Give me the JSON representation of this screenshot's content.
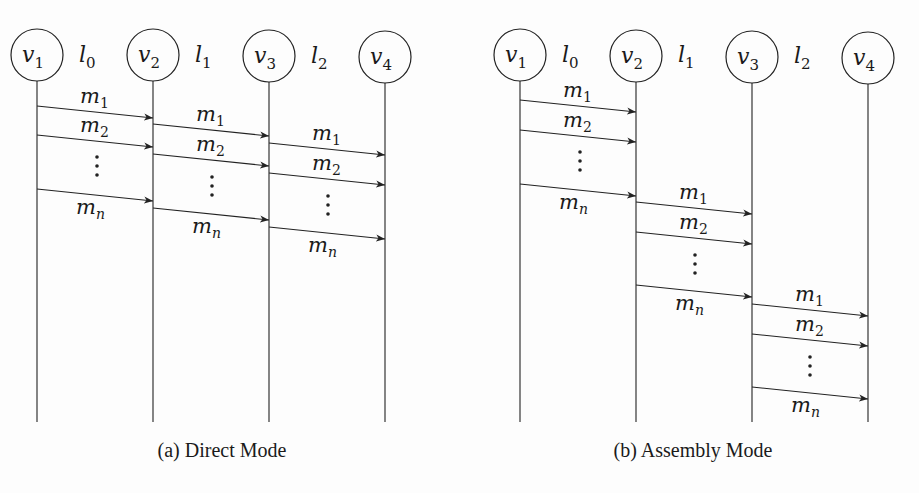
{
  "figures": [
    {
      "id": "a",
      "caption": "(a) Direct Mode",
      "caption_pos": [
        222,
        457
      ],
      "nodes": [
        {
          "label": "v",
          "sub": "1",
          "cx": 37,
          "cy": 55
        },
        {
          "label": "v",
          "sub": "2",
          "cx": 153,
          "cy": 55
        },
        {
          "label": "v",
          "sub": "3",
          "cx": 269,
          "cy": 56
        },
        {
          "label": "v",
          "sub": "4",
          "cx": 385,
          "cy": 57
        }
      ],
      "links": [
        {
          "label": "l",
          "sub": "0",
          "x": 87,
          "y": 62
        },
        {
          "label": "l",
          "sub": "1",
          "x": 203,
          "y": 62
        },
        {
          "label": "l",
          "sub": "2",
          "x": 319,
          "y": 63
        }
      ],
      "lifeline_bottom": 422,
      "messages": [
        {
          "label": "m",
          "sub": "1",
          "x1": 37,
          "y1": 106,
          "x2": 153,
          "y2": 118,
          "lx": 80,
          "ly": 103
        },
        {
          "label": "m",
          "sub": "2",
          "x1": 37,
          "y1": 135,
          "x2": 153,
          "y2": 147,
          "lx": 80,
          "ly": 132
        },
        {
          "label": "m",
          "sub": "n",
          "x1": 37,
          "y1": 189,
          "x2": 153,
          "y2": 201,
          "lx": 76,
          "ly": 214
        },
        {
          "label": "m",
          "sub": "1",
          "x1": 153,
          "y1": 124,
          "x2": 269,
          "y2": 136,
          "lx": 196,
          "ly": 121
        },
        {
          "label": "m",
          "sub": "2",
          "x1": 153,
          "y1": 154,
          "x2": 269,
          "y2": 166,
          "lx": 196,
          "ly": 151
        },
        {
          "label": "m",
          "sub": "n",
          "x1": 153,
          "y1": 208,
          "x2": 269,
          "y2": 220,
          "lx": 192,
          "ly": 233
        },
        {
          "label": "m",
          "sub": "1",
          "x1": 269,
          "y1": 143,
          "x2": 385,
          "y2": 155,
          "lx": 312,
          "ly": 140
        },
        {
          "label": "m",
          "sub": "2",
          "x1": 269,
          "y1": 173,
          "x2": 385,
          "y2": 185,
          "lx": 312,
          "ly": 170
        },
        {
          "label": "m",
          "sub": "n",
          "x1": 269,
          "y1": 227,
          "x2": 385,
          "y2": 239,
          "lx": 308,
          "ly": 252
        }
      ],
      "ellipses": [
        {
          "x": 97,
          "y": 157
        },
        {
          "x": 212,
          "y": 177
        },
        {
          "x": 328,
          "y": 196
        }
      ]
    },
    {
      "id": "b",
      "caption": "(b) Assembly Mode",
      "caption_pos": [
        693,
        457
      ],
      "nodes": [
        {
          "label": "v",
          "sub": "1",
          "cx": 520,
          "cy": 55
        },
        {
          "label": "v",
          "sub": "2",
          "cx": 636,
          "cy": 56
        },
        {
          "label": "v",
          "sub": "3",
          "cx": 752,
          "cy": 57
        },
        {
          "label": "v",
          "sub": "4",
          "cx": 868,
          "cy": 58
        }
      ],
      "links": [
        {
          "label": "l",
          "sub": "0",
          "x": 570,
          "y": 62
        },
        {
          "label": "l",
          "sub": "1",
          "x": 686,
          "y": 62
        },
        {
          "label": "l",
          "sub": "2",
          "x": 802,
          "y": 63
        }
      ],
      "lifeline_bottom": 422,
      "messages": [
        {
          "label": "m",
          "sub": "1",
          "x1": 520,
          "y1": 100,
          "x2": 636,
          "y2": 112,
          "lx": 563,
          "ly": 97
        },
        {
          "label": "m",
          "sub": "2",
          "x1": 520,
          "y1": 130,
          "x2": 636,
          "y2": 142,
          "lx": 563,
          "ly": 127
        },
        {
          "label": "m",
          "sub": "n",
          "x1": 520,
          "y1": 184,
          "x2": 636,
          "y2": 196,
          "lx": 559,
          "ly": 209
        },
        {
          "label": "m",
          "sub": "1",
          "x1": 636,
          "y1": 202,
          "x2": 752,
          "y2": 214,
          "lx": 679,
          "ly": 199
        },
        {
          "label": "m",
          "sub": "2",
          "x1": 636,
          "y1": 232,
          "x2": 752,
          "y2": 244,
          "lx": 679,
          "ly": 229
        },
        {
          "label": "m",
          "sub": "n",
          "x1": 636,
          "y1": 285,
          "x2": 752,
          "y2": 297,
          "lx": 675,
          "ly": 310
        },
        {
          "label": "m",
          "sub": "1",
          "x1": 752,
          "y1": 304,
          "x2": 868,
          "y2": 316,
          "lx": 795,
          "ly": 301
        },
        {
          "label": "m",
          "sub": "2",
          "x1": 752,
          "y1": 334,
          "x2": 868,
          "y2": 346,
          "lx": 795,
          "ly": 331
        },
        {
          "label": "m",
          "sub": "n",
          "x1": 752,
          "y1": 387,
          "x2": 868,
          "y2": 399,
          "lx": 791,
          "ly": 412
        }
      ],
      "ellipses": [
        {
          "x": 580,
          "y": 152
        },
        {
          "x": 695,
          "y": 255
        },
        {
          "x": 810,
          "y": 357
        }
      ]
    }
  ]
}
